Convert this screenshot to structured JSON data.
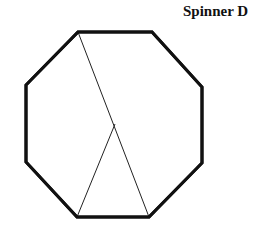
{
  "title": "Spinner D",
  "spinner": {
    "shape": "octagon",
    "colors": {
      "outline": "#111111",
      "divider": "#222222",
      "background": "#ffffff"
    },
    "outline_width": 3,
    "divider_width": 1,
    "vertices": [
      [
        78,
        32
      ],
      [
        152,
        32
      ],
      [
        202,
        87
      ],
      [
        202,
        163
      ],
      [
        149,
        217
      ],
      [
        77,
        217
      ],
      [
        26,
        162
      ],
      [
        26,
        85
      ]
    ],
    "dividers": [
      {
        "from": [
          78,
          32
        ],
        "to": [
          149,
          217
        ]
      },
      {
        "from": [
          77,
          217
        ],
        "to": [
          115,
          124
        ]
      }
    ],
    "sections": 3
  }
}
